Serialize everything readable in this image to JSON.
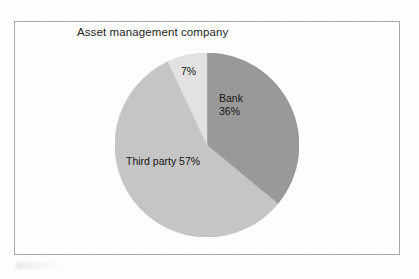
{
  "figure": {
    "title": "Asset management company",
    "frame_color": "#a8a8a8",
    "background_color": "#fefefe"
  },
  "labels": {
    "bank_name": "Bank",
    "bank_pct": "36%",
    "third_party": "Third party 57%",
    "other_pct": "7%"
  },
  "chart_data": {
    "type": "pie",
    "title": "Asset management company",
    "xlabel": "",
    "ylabel": "",
    "categories": [
      "Bank",
      "Third party",
      "Other"
    ],
    "values": [
      36,
      57,
      7
    ],
    "labels_shown": [
      "Bank 36%",
      "Third party 57%",
      "7%"
    ],
    "slice_colors": [
      "#9a9a9a",
      "#c6c6c6",
      "#e3e3e3"
    ],
    "start_angle_deg": 0,
    "direction": "clockwise",
    "units": "percent",
    "total": 100,
    "legend": "none",
    "grid": false,
    "data_label_position": "inside"
  }
}
